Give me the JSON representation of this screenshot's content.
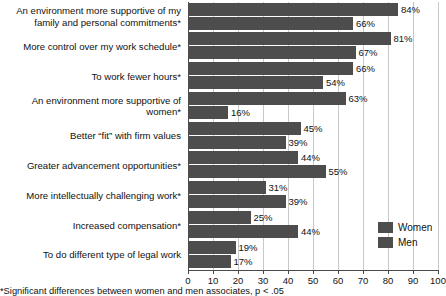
{
  "chart_data": {
    "type": "bar",
    "orientation": "horizontal",
    "title": "",
    "xlabel": "",
    "ylabel": "",
    "xlim": [
      0,
      100
    ],
    "xticks": [
      0,
      10,
      20,
      30,
      40,
      50,
      60,
      70,
      80,
      90,
      100
    ],
    "grid": true,
    "legend_position": "bottom-right",
    "value_suffix": "%",
    "categories": [
      "An environment more supportive of my family and personal commitments*",
      "More control over my work schedule*",
      "To work fewer hours*",
      "An environment more supportive of women*",
      "Better “fit” with firm values",
      "Greater advancement opportunities*",
      "More intellectually challenging work*",
      "Increased compensation*",
      "To do different type of legal work"
    ],
    "series": [
      {
        "name": "Women",
        "color": "#4d4d4d",
        "values": [
          84,
          81,
          66,
          63,
          45,
          44,
          31,
          25,
          19
        ]
      },
      {
        "name": "Men",
        "color": "#4d4d4d",
        "values": [
          66,
          67,
          54,
          16,
          39,
          55,
          39,
          44,
          17
        ]
      }
    ],
    "value_labels": {
      "women": [
        "84%",
        "81%",
        "66%",
        "63%",
        "45%",
        "44%",
        "31%",
        "25%",
        "19%"
      ],
      "men": [
        "66%",
        "67%",
        "54%",
        "16%",
        "39%",
        "55%",
        "39%",
        "44%",
        "17%"
      ]
    },
    "tick_labels": [
      "0",
      "10",
      "20",
      "30",
      "40",
      "50",
      "60",
      "70",
      "80",
      "90",
      "100"
    ],
    "footnote": "*Significant differences between women and men associates, p < .05"
  },
  "legend": {
    "items": [
      {
        "label": "Women"
      },
      {
        "label": "Men"
      }
    ]
  }
}
